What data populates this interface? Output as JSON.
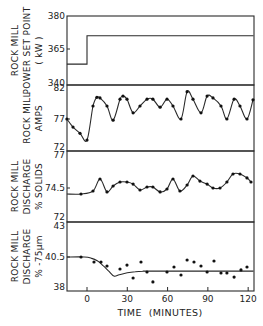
{
  "chart_data": {
    "type": "line",
    "title": "",
    "xlabel": "TIME (MINUTES)",
    "x_ticks": [
      0,
      30,
      60,
      90,
      120
    ],
    "xlim": [
      -15,
      124
    ],
    "grid": false,
    "legend": "none",
    "panels": [
      {
        "id": "power",
        "ylabel_lines": [
          "ROCK MILL",
          "POWER SET POINT",
          "( kW )"
        ],
        "y_ticks": [
          380,
          365,
          340
        ],
        "y_tick_labels": [
          "380",
          "365",
          "340"
        ],
        "ylim": [
          340,
          380
        ],
        "axis_break": true,
        "series": [
          {
            "name": "set point",
            "style": "step",
            "x": [
              -15,
              0,
              0,
              124
            ],
            "y": [
              354.5,
              354.5,
              371,
              371
            ]
          }
        ]
      },
      {
        "id": "amps",
        "ylabel_lines": [
          "ROCK MILL",
          "AMPS"
        ],
        "y_ticks": [
          82,
          77,
          72
        ],
        "y_tick_labels": [
          "82",
          "77",
          "72"
        ],
        "ylim": [
          72,
          82
        ],
        "series": [
          {
            "name": "measured",
            "style": "line+markers",
            "x": [
              -15,
              -10.4,
              -5.2,
              0,
              4.5,
              7.4,
              9.7,
              14.9,
              19.4,
              24.6,
              26.8,
              29.8,
              34.3,
              39.5,
              44.7,
              49.1,
              54.4,
              59.6,
              64.0,
              70.0,
              74.5,
              78.9,
              84.9,
              89.4,
              93.8,
              99.8,
              104.2,
              109.5,
              113.9,
              119.1,
              123.6
            ],
            "y": [
              77.0,
              75.7,
              74.7,
              73.6,
              79.1,
              80.5,
              80.4,
              79.1,
              76.8,
              80.2,
              80.7,
              80.2,
              78.0,
              79.1,
              80.2,
              80.2,
              78.9,
              80.2,
              79.1,
              77.0,
              81.4,
              80.2,
              78.0,
              80.7,
              80.4,
              79.1,
              77.0,
              80.2,
              79.1,
              77.0,
              80.1
            ]
          }
        ]
      },
      {
        "id": "solids",
        "ylabel_lines": [
          "ROCK MILL",
          "DISCHARGE",
          "% SOLIDS"
        ],
        "y_ticks": [
          77,
          74.5,
          72
        ],
        "y_tick_labels": [
          "77",
          "74.5",
          "72"
        ],
        "ylim": [
          72,
          77
        ],
        "series": [
          {
            "name": "measured",
            "style": "line+markers",
            "x": [
              -15,
              -4.5,
              4.5,
              9.7,
              14.9,
              19.4,
              24.6,
              29.8,
              34.3,
              39.5,
              44.7,
              49.1,
              54.4,
              59.6,
              64.0,
              69.2,
              74.5,
              78.9,
              84.1,
              89.4,
              93.8,
              99.0,
              104.2,
              108.7,
              113.9,
              119.1,
              122.1
            ],
            "y": [
              74.06,
              74.06,
              74.28,
              75.16,
              74.21,
              74.65,
              74.94,
              74.94,
              74.79,
              74.35,
              74.57,
              74.57,
              74.21,
              74.43,
              75.16,
              74.28,
              74.72,
              75.38,
              75.01,
              74.79,
              74.5,
              74.5,
              74.94,
              75.53,
              75.53,
              75.24,
              74.94
            ],
            "marker_from_index": 1
          }
        ]
      },
      {
        "id": "fines",
        "ylabel_lines": [
          "ROCK MILL",
          "DISCHARGE",
          "% -75µm"
        ],
        "y_ticks": [
          43,
          40.5,
          38
        ],
        "y_tick_labels": [
          "43",
          "40.5",
          "38"
        ],
        "ylim": [
          38,
          43
        ],
        "series": [
          {
            "name": "model",
            "style": "line",
            "x": [
              -15,
              -2,
              3,
              8,
              12,
              16,
              20,
              24,
              30,
              36,
              42,
              50,
              124
            ],
            "y": [
              40.5,
              40.5,
              40.42,
              40.2,
              39.85,
              39.45,
              39.05,
              39.15,
              39.3,
              39.38,
              39.42,
              39.43,
              39.43
            ]
          },
          {
            "name": "measured",
            "style": "markers",
            "x": [
              -4.5,
              5.2,
              10.4,
              14.9,
              24.6,
              29.8,
              34.3,
              40.2,
              44.7,
              49.1,
              59.6,
              64.8,
              70.0,
              74.5,
              79.7,
              84.9,
              89.4,
              94.6,
              99.8,
              104.2,
              109.5,
              114.7,
              119.1
            ],
            "y": [
              40.5,
              40.12,
              40.12,
              39.82,
              39.59,
              39.89,
              38.91,
              40.12,
              39.36,
              38.61,
              39.36,
              39.74,
              39.14,
              40.27,
              40.12,
              39.82,
              39.36,
              40.2,
              39.29,
              39.29,
              38.98,
              39.52,
              39.74
            ]
          }
        ]
      }
    ]
  }
}
